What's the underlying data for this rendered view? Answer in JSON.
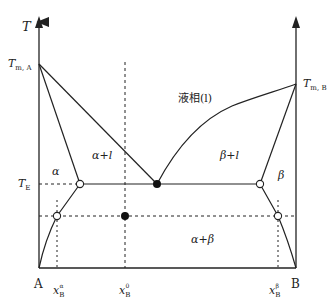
{
  "diagram": {
    "type": "binary eutectic phase diagram",
    "axes": {
      "y_label": "T",
      "left_component": "A",
      "right_component": "B"
    },
    "temperatures": {
      "melting_A": {
        "symbol": "T",
        "subscript": "m, A"
      },
      "melting_B": {
        "symbol": "T",
        "subscript": "m, B"
      },
      "eutectic": {
        "symbol": "T",
        "subscript": "E"
      }
    },
    "regions": {
      "liquid": "液相(l)",
      "alpha": "α",
      "alpha_plus_liquid": "α+l",
      "beta_plus_liquid": "β+l",
      "beta": "β",
      "alpha_plus_beta": "α+β"
    },
    "compositions": {
      "x_alpha": {
        "symbol": "x",
        "subscript": "B",
        "superscript": "α"
      },
      "x_overall": {
        "symbol": "x",
        "subscript": "B",
        "superscript": "0"
      },
      "x_beta": {
        "symbol": "x",
        "subscript": "B",
        "superscript": "β"
      }
    },
    "markers": {
      "eutectic_point": "filled",
      "overall_point": "filled",
      "alpha_eutectic_end": "open",
      "beta_eutectic_end": "open",
      "alpha_tie_end": "open",
      "beta_tie_end": "open"
    },
    "colors": {
      "line": "#222222",
      "background": "#ffffff"
    }
  }
}
